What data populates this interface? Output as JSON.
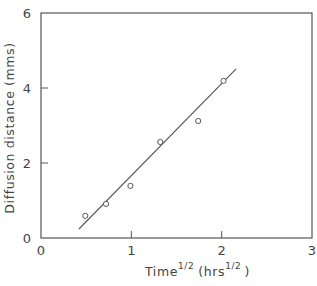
{
  "chart_data": {
    "type": "scatter",
    "title": "",
    "xlabel": "Time^1/2 (hrs^1/2)",
    "xlabel_parts": {
      "main": "Time",
      "main_sup": "1/2",
      "unit_open": "(hrs",
      "unit_sup": "1/2",
      "unit_close": ")"
    },
    "ylabel": "Diffusion distance (mms)",
    "xlim": [
      0,
      3
    ],
    "ylim": [
      0,
      6
    ],
    "x_ticks": [
      0,
      1,
      2,
      3
    ],
    "x_tick_labels": [
      "0",
      "1",
      "2",
      "3"
    ],
    "y_ticks": [
      0,
      2,
      4,
      6
    ],
    "y_tick_labels": [
      "0",
      "2",
      "4",
      "6"
    ],
    "grid": false,
    "legend": null,
    "series": [
      {
        "name": "measured",
        "marker": "open-circle",
        "x": [
          0.49,
          0.72,
          0.99,
          1.32,
          1.74,
          2.02
        ],
        "y": [
          0.59,
          0.91,
          1.39,
          2.56,
          3.12,
          4.19
        ]
      },
      {
        "name": "linear fit",
        "style": "line",
        "x": [
          0.42,
          2.16
        ],
        "y": [
          0.24,
          4.51
        ]
      }
    ]
  },
  "colors": {
    "axis": "#555555",
    "data": "#555555",
    "text": "#444444"
  }
}
